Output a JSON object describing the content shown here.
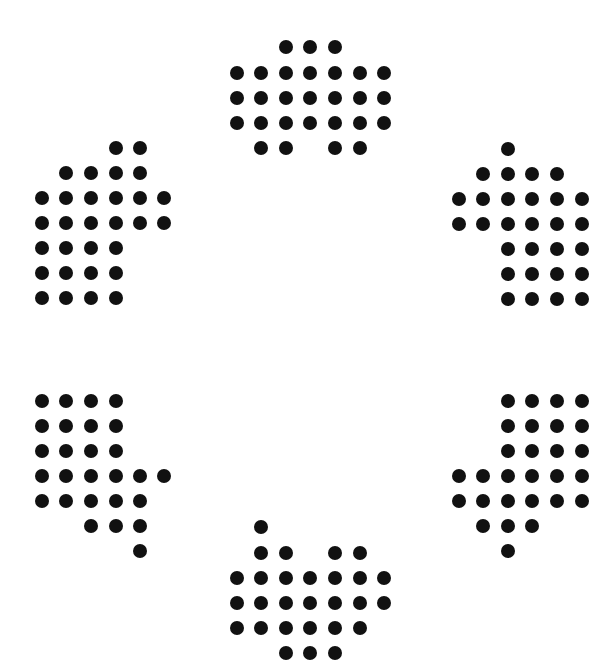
{
  "canvas": {
    "width": 612,
    "height": 653,
    "background": "#ffffff",
    "dot_color": "#111111",
    "dot_diameter": 14
  },
  "groups": [
    {
      "name": "top",
      "cols_x": [
        237,
        261,
        286,
        310,
        335,
        360,
        384
      ],
      "rows_y": [
        47,
        73,
        98,
        123,
        148
      ],
      "rows": [
        [
          2,
          3,
          4
        ],
        [
          0,
          1,
          2,
          3,
          4,
          5,
          6
        ],
        [
          0,
          1,
          2,
          3,
          4,
          5,
          6
        ],
        [
          0,
          1,
          2,
          3,
          4,
          5,
          6
        ],
        [
          1,
          2,
          4,
          5
        ]
      ]
    },
    {
      "name": "upper-left",
      "cols_x": [
        42,
        66,
        91,
        116,
        140,
        164
      ],
      "rows_y": [
        148,
        173,
        198,
        223,
        248,
        273,
        298
      ],
      "rows": [
        [
          3,
          4
        ],
        [
          1,
          2,
          3,
          4
        ],
        [
          0,
          1,
          2,
          3,
          4,
          5
        ],
        [
          0,
          1,
          2,
          3,
          4,
          5
        ],
        [
          0,
          1,
          2,
          3
        ],
        [
          0,
          1,
          2,
          3
        ],
        [
          0,
          1,
          2,
          3
        ]
      ]
    },
    {
      "name": "upper-right",
      "cols_x": [
        459,
        483,
        508,
        532,
        557,
        582
      ],
      "rows_y": [
        149,
        174,
        199,
        224,
        249,
        274,
        299
      ],
      "rows": [
        [
          2
        ],
        [
          1,
          2,
          3,
          4
        ],
        [
          0,
          1,
          2,
          3,
          4,
          5
        ],
        [
          0,
          1,
          2,
          3,
          4,
          5
        ],
        [
          2,
          3,
          4,
          5
        ],
        [
          2,
          3,
          4,
          5
        ],
        [
          2,
          3,
          4,
          5
        ]
      ]
    },
    {
      "name": "lower-left",
      "cols_x": [
        42,
        66,
        91,
        116,
        140,
        164
      ],
      "rows_y": [
        401,
        426,
        451,
        476,
        501,
        526,
        551
      ],
      "rows": [
        [
          0,
          1,
          2,
          3
        ],
        [
          0,
          1,
          2,
          3
        ],
        [
          0,
          1,
          2,
          3
        ],
        [
          0,
          1,
          2,
          3,
          4,
          5
        ],
        [
          0,
          1,
          2,
          3,
          4
        ],
        [
          2,
          3,
          4
        ],
        [
          4
        ]
      ]
    },
    {
      "name": "lower-right",
      "cols_x": [
        459,
        483,
        508,
        532,
        557,
        582
      ],
      "rows_y": [
        401,
        426,
        451,
        476,
        501,
        526,
        551
      ],
      "rows": [
        [
          2,
          3,
          4,
          5
        ],
        [
          2,
          3,
          4,
          5
        ],
        [
          2,
          3,
          4,
          5
        ],
        [
          0,
          1,
          2,
          3,
          4,
          5
        ],
        [
          0,
          1,
          2,
          3,
          4,
          5
        ],
        [
          1,
          2,
          3
        ],
        [
          2
        ]
      ]
    },
    {
      "name": "bottom",
      "cols_x": [
        237,
        261,
        286,
        310,
        335,
        360,
        384
      ],
      "rows_y": [
        527,
        553,
        578,
        603,
        628,
        653
      ],
      "rows": [
        [
          1
        ],
        [
          1,
          2,
          4,
          5
        ],
        [
          0,
          1,
          2,
          3,
          4,
          5,
          6
        ],
        [
          0,
          1,
          2,
          3,
          4,
          5,
          6
        ],
        [
          0,
          1,
          2,
          3,
          4,
          5
        ],
        [
          2,
          3,
          4
        ]
      ]
    }
  ]
}
